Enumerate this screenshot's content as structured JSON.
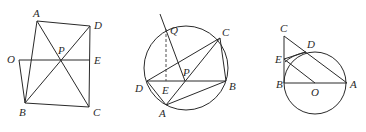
{
  "figures": [
    {
      "id": "figure-1",
      "description": "Quadrilateral ABCD with diagonals intersecting at P, segment OE through P",
      "points": {
        "A": [
          37,
          21
        ],
        "D": [
          90,
          26
        ],
        "O": [
          19,
          60
        ],
        "P": [
          60,
          60
        ],
        "E": [
          90,
          60
        ],
        "B": [
          25,
          103
        ],
        "C": [
          89,
          107
        ]
      },
      "labels": {
        "A": {
          "text": "A",
          "x": 33,
          "y": 17
        },
        "D": {
          "text": "D",
          "x": 94,
          "y": 29
        },
        "O": {
          "text": "O",
          "x": 7,
          "y": 63
        },
        "P": {
          "text": "P",
          "x": 58,
          "y": 54
        },
        "E": {
          "text": "E",
          "x": 94,
          "y": 64
        },
        "B": {
          "text": "B",
          "x": 19,
          "y": 116
        },
        "C": {
          "text": "C",
          "x": 93,
          "y": 116
        }
      }
    },
    {
      "id": "figure-2",
      "description": "Circle with inscribed quadrilateral ADBC... chord DB, point P, line through Q, dashed QE",
      "circle": {
        "cx": 186,
        "cy": 68,
        "r": 42
      },
      "points": {
        "Q": [
          166,
          29
        ],
        "C": [
          220,
          38
        ],
        "P": [
          185,
          81
        ],
        "D": [
          147,
          81
        ],
        "E": [
          166,
          81
        ],
        "B": [
          226,
          81
        ],
        "A": [
          166,
          105
        ],
        "T": [
          160,
          14
        ]
      },
      "labels": {
        "Q": {
          "text": "Q",
          "x": 170,
          "y": 34
        },
        "C": {
          "text": "C",
          "x": 222,
          "y": 36
        },
        "P": {
          "text": "P",
          "x": 183,
          "y": 76
        },
        "D": {
          "text": "D",
          "x": 135,
          "y": 92
        },
        "E": {
          "text": "E",
          "x": 162,
          "y": 94
        },
        "B": {
          "text": "B",
          "x": 229,
          "y": 90
        },
        "A": {
          "text": "A",
          "x": 159,
          "y": 117
        }
      }
    },
    {
      "id": "figure-3",
      "description": "Circle with center O, diameter AB, tangent line BC, points D and E",
      "circle": {
        "cx": 315,
        "cy": 83,
        "r": 31
      },
      "points": {
        "C": [
          284,
          36
        ],
        "E": [
          284,
          59
        ],
        "B": [
          284,
          83
        ],
        "O": [
          315,
          83
        ],
        "A": [
          347,
          83
        ],
        "D": [
          306,
          52
        ]
      },
      "labels": {
        "C": {
          "text": "C",
          "x": 280,
          "y": 32
        },
        "D": {
          "text": "D",
          "x": 307,
          "y": 48
        },
        "E": {
          "text": "E",
          "x": 275,
          "y": 63
        },
        "B": {
          "text": "B",
          "x": 276,
          "y": 88
        },
        "O": {
          "text": "O",
          "x": 311,
          "y": 96
        },
        "A": {
          "text": "A",
          "x": 350,
          "y": 88
        }
      }
    }
  ]
}
